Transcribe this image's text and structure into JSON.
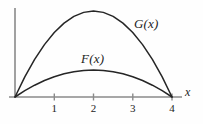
{
  "figure": {
    "title": "",
    "background_color": "#fefefe",
    "line_color": "#252525",
    "axis_color": "#6e6e6e"
  },
  "axes": {
    "x_axis_label": "x",
    "y_axis_label": "",
    "x_ticks": [
      {
        "label": "1",
        "value": 1
      },
      {
        "label": "2",
        "value": 2
      },
      {
        "label": "3",
        "value": 3
      },
      {
        "label": "4",
        "value": 4
      }
    ],
    "x_range": [
      0,
      4.45
    ],
    "y_range": [
      0,
      1.1
    ],
    "grid": false
  },
  "labels": {
    "g_label": "G(x)",
    "f_label": "F(x)"
  },
  "chart_data": {
    "type": "line",
    "title": "",
    "xlabel": "x",
    "ylabel": "",
    "xlim": [
      0,
      4.45
    ],
    "ylim": [
      0,
      1.05
    ],
    "grid": false,
    "legend": "inline-curve-labels",
    "annotations": [
      {
        "text": "G(x)",
        "x": 3.05,
        "y": 0.78
      },
      {
        "text": "F(x)",
        "x": 1.75,
        "y": 0.44
      }
    ],
    "series": [
      {
        "name": "G(x)",
        "description": "Upper parabolic arc through (0,0) and (4,0), peak at x=2",
        "x": [
          0,
          0.25,
          0.5,
          0.75,
          1,
          1.25,
          1.5,
          1.75,
          2,
          2.25,
          2.5,
          2.75,
          3,
          3.25,
          3.5,
          3.75,
          4
        ],
        "values": [
          0,
          0.234,
          0.438,
          0.609,
          0.75,
          0.859,
          0.938,
          0.984,
          1.0,
          0.984,
          0.938,
          0.859,
          0.75,
          0.609,
          0.438,
          0.234,
          0
        ]
      },
      {
        "name": "F(x)",
        "description": "Lower parabolic arc through (0,0) and (4,0), peak at x=2",
        "x": [
          0,
          0.25,
          0.5,
          0.75,
          1,
          1.25,
          1.5,
          1.75,
          2,
          2.25,
          2.5,
          2.75,
          3,
          3.25,
          3.5,
          3.75,
          4
        ],
        "values": [
          0,
          0.076,
          0.142,
          0.198,
          0.244,
          0.279,
          0.305,
          0.32,
          0.325,
          0.32,
          0.305,
          0.279,
          0.244,
          0.198,
          0.142,
          0.076,
          0
        ]
      }
    ]
  }
}
